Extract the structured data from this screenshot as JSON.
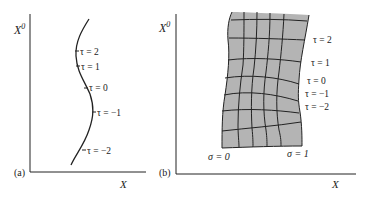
{
  "figure": {
    "panel_a": {
      "tag": "(a)",
      "y_axis_label": "X",
      "y_axis_superscript": "0",
      "x_axis_label": "X",
      "curve": "worldline",
      "tick_labels": [
        "τ = 2",
        "τ = 1",
        "τ = 0",
        "τ = −1",
        "τ = −2"
      ]
    },
    "panel_b": {
      "tag": "(b)",
      "y_axis_label": "X",
      "y_axis_superscript": "0",
      "x_axis_label": "X",
      "surface": "worldsheet",
      "surface_color": "#b4b4b4",
      "tau_labels": [
        "τ = 2",
        "τ = 1",
        "τ = 0",
        "τ = −1",
        "τ = −2"
      ],
      "sigma_labels": [
        "σ = 0",
        "σ = 1"
      ],
      "grid": {
        "sigma_lines": 6,
        "tau_lines": 8
      }
    },
    "colors": {
      "ink": "#222222",
      "sheet": "#b4b4b4",
      "background": "#ffffff"
    }
  }
}
